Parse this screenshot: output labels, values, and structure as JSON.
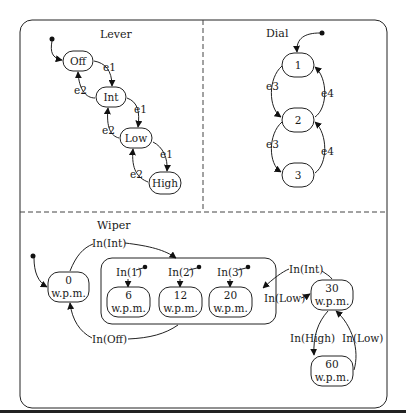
{
  "diagram": {
    "type": "statechart",
    "regions": {
      "lever": {
        "title": "Lever",
        "states": [
          "Off",
          "Int",
          "Low",
          "High"
        ],
        "events": {
          "forward": "e1",
          "back": "e2"
        }
      },
      "dial": {
        "title": "Dial",
        "states": [
          "1",
          "2",
          "3"
        ],
        "events": {
          "forward": "e3",
          "back": "e4"
        }
      },
      "wiper": {
        "title": "Wiper",
        "unit": "w.p.m.",
        "states": {
          "s0": "0",
          "s6": "6",
          "s12": "12",
          "s20": "20",
          "s30": "30",
          "s60": "60"
        },
        "events": {
          "in_int_top": "In(Int)",
          "in_off": "In(Off)",
          "in_1": "In(1)",
          "in_2": "In(2)",
          "in_3": "In(3)",
          "in_int_right": "In(Int)",
          "in_low_left": "In(Low)",
          "in_high": "In(High)",
          "in_low_right": "In(Low)"
        }
      }
    }
  }
}
